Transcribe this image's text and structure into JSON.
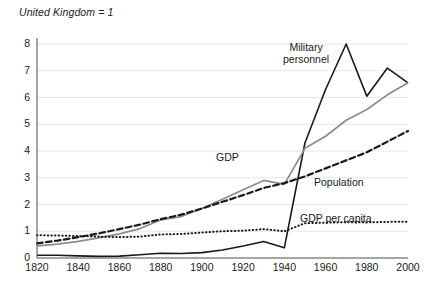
{
  "chart_data": {
    "type": "line",
    "title": "United Kingdom = 1",
    "subtitle": "",
    "xlabel": "",
    "ylabel": "",
    "xlim": [
      1820,
      2000
    ],
    "ylim": [
      0,
      8
    ],
    "grid": true,
    "grid_axis": "y",
    "legend_position": "inline-annotations",
    "x_ticks": [
      1820,
      1840,
      1860,
      1880,
      1900,
      1920,
      1940,
      1960,
      1980,
      2000
    ],
    "y_ticks": [
      0,
      1,
      2,
      3,
      4,
      5,
      6,
      7,
      8
    ],
    "x": [
      1820,
      1830,
      1840,
      1850,
      1860,
      1870,
      1880,
      1890,
      1900,
      1910,
      1920,
      1930,
      1940,
      1950,
      1960,
      1970,
      1980,
      1990,
      2000
    ],
    "series": [
      {
        "name": "Military personnel",
        "key": "military",
        "style": "solid",
        "color": "#1a1a1a",
        "width": 1.6,
        "values": [
          0.1,
          0.1,
          0.08,
          0.06,
          0.07,
          0.12,
          0.18,
          0.17,
          0.2,
          0.3,
          0.45,
          0.62,
          0.38,
          4.3,
          6.3,
          8.0,
          6.05,
          7.1,
          6.55
        ]
      },
      {
        "name": "GDP",
        "key": "gdp",
        "style": "solid",
        "color": "#8c8c8c",
        "width": 1.7,
        "values": [
          0.45,
          0.52,
          0.62,
          0.75,
          0.9,
          1.1,
          1.42,
          1.55,
          1.85,
          2.2,
          2.55,
          2.9,
          2.75,
          4.1,
          4.55,
          5.15,
          5.55,
          6.1,
          6.55
        ]
      },
      {
        "name": "Population",
        "key": "population",
        "style": "dashed",
        "color": "#1a1a1a",
        "width": 2.2,
        "values": [
          0.55,
          0.65,
          0.78,
          0.92,
          1.08,
          1.25,
          1.45,
          1.62,
          1.85,
          2.1,
          2.35,
          2.62,
          2.8,
          3.05,
          3.35,
          3.65,
          3.95,
          4.35,
          4.75
        ]
      },
      {
        "name": "GDP per capita",
        "key": "gdp_per_capita",
        "style": "dotted",
        "color": "#1a1a1a",
        "width": 2.0,
        "values": [
          0.85,
          0.84,
          0.82,
          0.8,
          0.78,
          0.8,
          0.88,
          0.9,
          0.95,
          1.0,
          1.02,
          1.08,
          1.0,
          1.3,
          1.32,
          1.34,
          1.33,
          1.35,
          1.36
        ]
      }
    ],
    "annotations": [
      {
        "key": "military",
        "text": "Military personnel",
        "line1": "Military",
        "line2": "personnel"
      },
      {
        "key": "gdp",
        "text": "GDP"
      },
      {
        "key": "population",
        "text": "Population"
      },
      {
        "key": "gdp_per_capita",
        "text": "GDP per capita"
      }
    ]
  },
  "axis": {
    "y_tick_labels": [
      "8",
      "7",
      "6",
      "5",
      "4",
      "3",
      "2",
      "1",
      "0"
    ],
    "x_tick_labels": [
      "1820",
      "1840",
      "1860",
      "1880",
      "1900",
      "1920",
      "1940",
      "1960",
      "1980",
      "2000"
    ]
  },
  "colors": {
    "gdp_line": "#8c8c8c",
    "dark_line": "#1a1a1a",
    "gridline": "#e6e6e6",
    "axis": "#4d4d4d",
    "background": "#ffffff"
  }
}
